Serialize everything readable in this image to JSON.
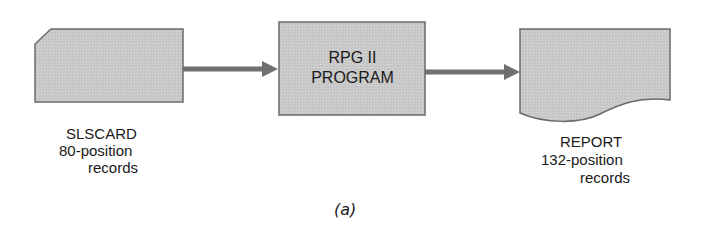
{
  "diagram": {
    "colors": {
      "fill": "#c8c8c8",
      "stroke": "#6a6a6a",
      "arrow": "#707070",
      "text": "#1a1a1a"
    },
    "nodes": [
      {
        "id": "slscard",
        "shape": "punched-card",
        "label_lines": [
          "SLSCARD",
          "80-position",
          "records"
        ]
      },
      {
        "id": "program",
        "shape": "process-box",
        "label_lines": [
          "RPG II",
          "PROGRAM"
        ]
      },
      {
        "id": "report",
        "shape": "document",
        "label_lines": [
          "REPORT",
          "132-position",
          "records"
        ]
      }
    ],
    "edges": [
      {
        "from": "slscard",
        "to": "program"
      },
      {
        "from": "program",
        "to": "report"
      }
    ],
    "caption": "(a)"
  }
}
